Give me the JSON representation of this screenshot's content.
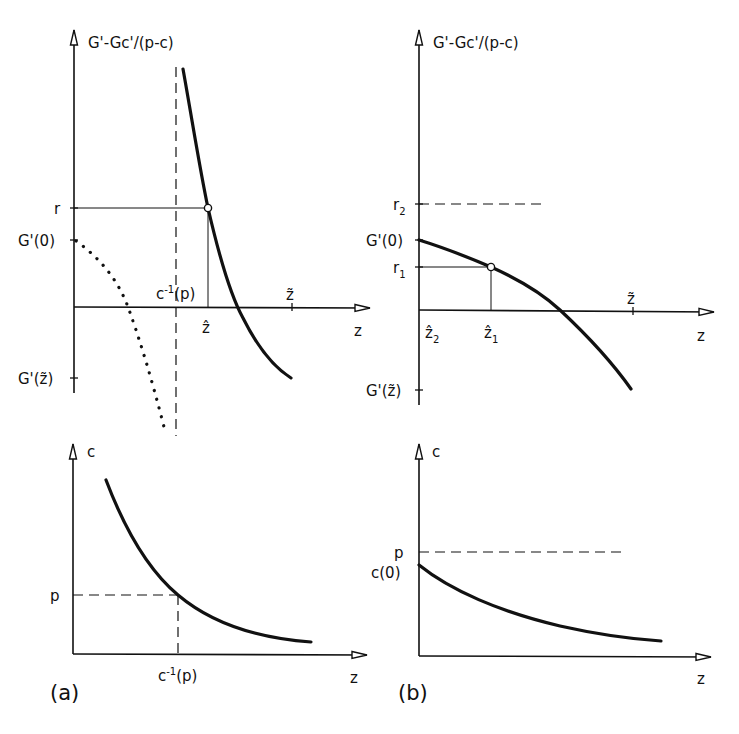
{
  "figure": {
    "panels": [
      {
        "id": "a",
        "caption": "(a)",
        "top": {
          "y_axis_label": "G'-Gc'/(p-c)",
          "x_axis_label": "z",
          "y_ticks": [
            "r",
            "G'(0)",
            "G'(z̃)"
          ],
          "x_ticks": [
            "ẑ",
            "z̃"
          ],
          "asymptote_label": "c⁻¹(p)",
          "annotations": {
            "r": "r",
            "g0": "G'(0)",
            "gz": "G'(z̃)",
            "zhat": "ẑ",
            "ztilde": "z̃",
            "cinv": "c",
            "cinv_sup": "-1",
            "cinv_arg": "(p)",
            "z": "z"
          },
          "curves": [
            {
              "name": "G'-Gc'/(p-c)",
              "style": "solid-thick",
              "shape": "decreasing convex, right of asymptote c⁻¹(p)"
            },
            {
              "name": "G'",
              "style": "dotted",
              "shape": "decreasing from G'(0), diverging near c⁻¹(p)"
            }
          ],
          "marker": "open circle at (ẑ, r)"
        },
        "bottom": {
          "y_axis_label": "c",
          "x_axis_label": "z",
          "y_ticks": [
            "p"
          ],
          "x_ticks": [
            "c⁻¹(p)"
          ],
          "annotations": {
            "c": "c",
            "p": "p",
            "cinv": "c",
            "cinv_sup": "-1",
            "cinv_arg": "(p)",
            "z": "z"
          },
          "curves": [
            {
              "name": "c(z)",
              "style": "solid-thick",
              "shape": "decreasing convex, crossing p at c⁻¹(p)"
            }
          ]
        }
      },
      {
        "id": "b",
        "caption": "(b)",
        "top": {
          "y_axis_label": "G'-Gc'/(p-c)",
          "x_axis_label": "z",
          "y_ticks": [
            "r₂",
            "G'(0)",
            "r₁",
            "G'(z̃)"
          ],
          "x_ticks": [
            "ẑ₂",
            "ẑ₁",
            "z̃"
          ],
          "annotations": {
            "r2": "r",
            "r2_sub": "2",
            "g0": "G'(0)",
            "r1": "r",
            "r1_sub": "1",
            "gz": "G'(z̃)",
            "zhat2": "ẑ",
            "zhat2_sub": "2",
            "zhat1": "ẑ",
            "zhat1_sub": "1",
            "ztilde": "z̃",
            "z": "z"
          },
          "curves": [
            {
              "name": "G'-Gc'/(p-c)",
              "style": "solid-thick",
              "shape": "decreasing concave from G'(0) to G'(z̃)"
            }
          ],
          "marker": "open circle at (ẑ₁, r₁)"
        },
        "bottom": {
          "y_axis_label": "c",
          "x_axis_label": "z",
          "y_ticks": [
            "p",
            "c(0)"
          ],
          "annotations": {
            "c": "c",
            "p": "p",
            "c0": "c(0)",
            "z": "z"
          },
          "curves": [
            {
              "name": "c(z)",
              "style": "solid-thick",
              "shape": "decreasing convex from c(0) < p"
            }
          ]
        }
      }
    ]
  }
}
